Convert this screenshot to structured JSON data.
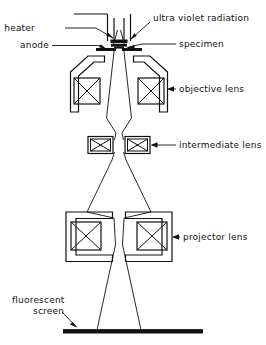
{
  "figure": {
    "kind": "schematic-diagram",
    "background_color": "#ffffff",
    "ink_color": "#111111"
  },
  "labels": {
    "heater": "heater",
    "anode": "anode",
    "uv_radiation": "ultra violet radiation",
    "specimen": "specimen",
    "objective_lens": "objective lens",
    "intermediate_lens": "intermediate lens",
    "projector_lens": "projector lens",
    "fluorescent_line1": "fluorescent",
    "fluorescent_line2": "screen"
  },
  "components": [
    {
      "id": "source-column",
      "label": "heater",
      "kind": "filament-column"
    },
    {
      "id": "anode-plate",
      "label": "anode",
      "kind": "aperture-plate"
    },
    {
      "id": "specimen-stage",
      "label": "specimen",
      "kind": "specimen"
    },
    {
      "id": "objective-lens",
      "label": "objective lens",
      "kind": "magnetic-lens"
    },
    {
      "id": "intermediate-lens",
      "label": "intermediate lens",
      "kind": "magnetic-lens"
    },
    {
      "id": "projector-lens",
      "label": "projector lens",
      "kind": "magnetic-lens"
    },
    {
      "id": "fluorescent-screen",
      "label": "screen",
      "kind": "screen"
    }
  ]
}
